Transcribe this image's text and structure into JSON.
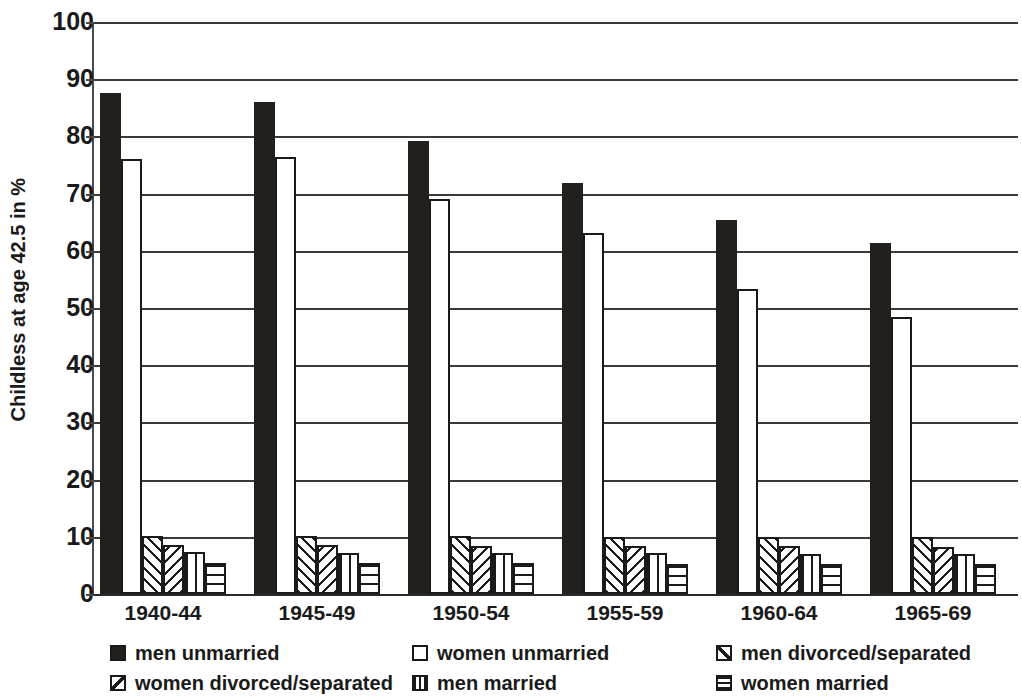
{
  "chart_data": {
    "type": "bar",
    "title": "",
    "subtitle": "",
    "xlabel": "",
    "ylabel": "Childless at age 42.5 in %",
    "categories": [
      "1940-44",
      "1945-49",
      "1950-54",
      "1955-59",
      "1960-64",
      "1965-69"
    ],
    "ylim": [
      0,
      100
    ],
    "ytick_step": 10,
    "yticks": [
      "0",
      "10",
      "20",
      "30",
      "40",
      "50",
      "60",
      "70",
      "80",
      "90",
      "100"
    ],
    "grid": true,
    "legend_position": "bottom",
    "series": [
      {
        "name": "men unmarried",
        "pattern": "solid-black",
        "values": [
          87.6,
          86.0,
          79.2,
          71.9,
          65.3,
          61.4
        ]
      },
      {
        "name": "women unmarried",
        "pattern": "empty-white",
        "values": [
          76.0,
          76.4,
          69.0,
          63.1,
          53.4,
          48.4
        ]
      },
      {
        "name": "men divorced/separated",
        "pattern": "forward-diagonal",
        "values": [
          10.2,
          10.2,
          10.1,
          10.0,
          10.0,
          10.0
        ]
      },
      {
        "name": "women divorced/separated",
        "pattern": "backward-diagonal",
        "values": [
          8.6,
          8.5,
          8.4,
          8.4,
          8.4,
          8.3
        ]
      },
      {
        "name": "men married",
        "pattern": "vertical-lines",
        "values": [
          7.4,
          7.2,
          7.1,
          7.1,
          7.0,
          7.0
        ]
      },
      {
        "name": "women married",
        "pattern": "horizontal-lines",
        "values": [
          5.5,
          5.4,
          5.4,
          5.3,
          5.3,
          5.2
        ]
      }
    ]
  },
  "legend": {
    "items": [
      {
        "label": "men unmarried",
        "swatch": "solid-black",
        "col": 0,
        "row": 0
      },
      {
        "label": "women unmarried",
        "swatch": "empty-white",
        "col": 1,
        "row": 0
      },
      {
        "label": "men divorced/separated",
        "swatch": "forward-diagonal",
        "col": 2,
        "row": 0
      },
      {
        "label": "women divorced/separated",
        "swatch": "backward-diagonal",
        "col": 0,
        "row": 1
      },
      {
        "label": "men married",
        "swatch": "vertical-lines",
        "col": 1,
        "row": 1
      },
      {
        "label": "women married",
        "swatch": "horizontal-lines",
        "col": 2,
        "row": 1
      }
    ]
  }
}
